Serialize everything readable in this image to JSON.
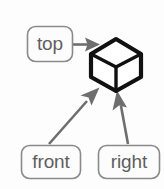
{
  "diagram": {
    "type": "node-arrow-diagram",
    "background_color": "#fdfdfd",
    "nodes": [
      {
        "id": "top",
        "label": "top",
        "shape": "rounded-rectangle",
        "x": 27,
        "y": 26,
        "width": 46,
        "height": 36,
        "text_color": "#5f5f5f",
        "border_color": "#8a8a8a",
        "fill_color": "#fcfcfc"
      },
      {
        "id": "front",
        "label": "front",
        "shape": "rounded-rectangle",
        "x": 21,
        "y": 145,
        "width": 60,
        "height": 34,
        "text_color": "#5f5f5f",
        "border_color": "#8a8a8a",
        "fill_color": "#fcfcfc"
      },
      {
        "id": "right",
        "label": "right",
        "shape": "rounded-rectangle",
        "x": 98,
        "y": 145,
        "width": 62,
        "height": 34,
        "text_color": "#5f5f5f",
        "border_color": "#8a8a8a",
        "fill_color": "#fcfcfc"
      }
    ],
    "target": {
      "id": "cube",
      "label": "cube",
      "shape": "isometric-cube",
      "center_x": 116,
      "center_y": 64,
      "outline_color": "#111111",
      "face_color": "#ffffff"
    },
    "arrows": [
      {
        "id": "top-to-cube",
        "from": "top",
        "to": "cube",
        "direction": "horizontal-right",
        "color": "#6e6e6e"
      },
      {
        "id": "front-to-cube",
        "from": "front",
        "to": "cube",
        "direction": "diagonal-up-right",
        "color": "#6e6e6e"
      },
      {
        "id": "right-to-cube",
        "from": "right",
        "to": "cube",
        "direction": "diagonal-up-left",
        "color": "#6e6e6e"
      }
    ]
  }
}
